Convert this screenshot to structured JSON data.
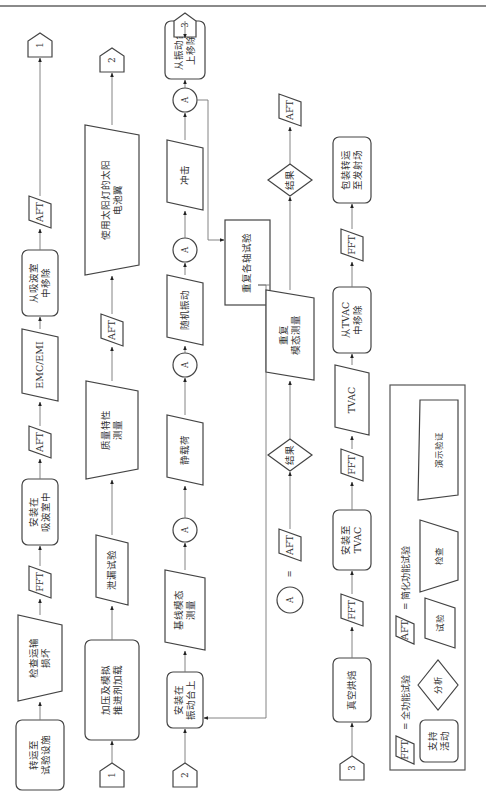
{
  "rows": [
    {
      "id": "row1",
      "nodes": [
        {
          "type": "rounded",
          "lines": [
            "转运至",
            "试验设施"
          ],
          "name": "node-transport-to-test-facility"
        },
        {
          "type": "trapezoid",
          "lines": [
            "检查运输",
            "损坏"
          ],
          "name": "node-inspect-shipping-damage"
        },
        {
          "type": "para",
          "lines": [
            "FFT"
          ],
          "name": "node-fft"
        },
        {
          "type": "rounded",
          "lines": [
            "安装在",
            "吸波室中"
          ],
          "name": "node-install-anechoic-chamber"
        },
        {
          "type": "para",
          "lines": [
            "AFT"
          ],
          "name": "node-aft"
        },
        {
          "type": "para",
          "lines": [
            "EMC/EMI"
          ],
          "name": "node-emc-emi"
        },
        {
          "type": "rounded",
          "lines": [
            "从吸波室",
            "中移除"
          ],
          "name": "node-remove-anechoic-chamber"
        },
        {
          "type": "para",
          "lines": [
            "AFT"
          ],
          "name": "node-aft"
        },
        {
          "type": "connector",
          "lines": [
            "1"
          ],
          "name": "offpage-connector-1"
        }
      ]
    },
    {
      "id": "row2",
      "nodes": [
        {
          "type": "connector",
          "lines": [
            "1"
          ],
          "name": "offpage-connector-1"
        },
        {
          "type": "rounded",
          "lines": [
            "加压及模拟",
            "推进剂加载"
          ],
          "name": "node-pressurize-propellant-load"
        },
        {
          "type": "para",
          "lines": [
            "泄漏试验"
          ],
          "name": "node-leak-test"
        },
        {
          "type": "trapezoid",
          "lines": [
            "质量特性",
            "测量"
          ],
          "name": "node-mass-properties"
        },
        {
          "type": "para",
          "lines": [
            "AFT"
          ],
          "name": "node-aft"
        },
        {
          "type": "trapezoid",
          "lines": [
            "使用太阳灯的太阳",
            "电池翼"
          ],
          "name": "node-solar-array-sun-lamp"
        },
        {
          "type": "connector",
          "lines": [
            "2"
          ],
          "name": "offpage-connector-2"
        }
      ]
    },
    {
      "id": "row3",
      "nodes": [
        {
          "type": "connector",
          "lines": [
            "2"
          ],
          "name": "offpage-connector-2"
        },
        {
          "type": "rounded",
          "lines": [
            "安装在",
            "振动台上"
          ],
          "name": "node-install-shaker"
        },
        {
          "type": "para",
          "lines": [
            "基线模态",
            "测量"
          ],
          "name": "node-baseline-modal"
        },
        {
          "type": "circle",
          "lines": [
            "A"
          ],
          "name": "node-a"
        },
        {
          "type": "para",
          "lines": [
            "静载荷"
          ],
          "name": "node-static-load"
        },
        {
          "type": "circle",
          "lines": [
            "A"
          ],
          "name": "node-a"
        },
        {
          "type": "para",
          "lines": [
            "随机振动"
          ],
          "name": "node-random-vibration"
        },
        {
          "type": "circle",
          "lines": [
            "A"
          ],
          "name": "node-a"
        },
        {
          "type": "para",
          "lines": [
            "冲击"
          ],
          "name": "node-shock"
        },
        {
          "type": "circle",
          "lines": [
            "A"
          ],
          "name": "node-a"
        },
        {
          "type": "rounded",
          "lines": [
            "从振动台",
            "上移除"
          ],
          "name": "node-remove-shaker"
        },
        {
          "type": "connector",
          "lines": [
            "3"
          ],
          "name": "offpage-connector-3"
        }
      ]
    },
    {
      "id": "row4",
      "nodes": [
        {
          "type": "connector",
          "lines": [
            "3"
          ],
          "name": "offpage-connector-3"
        },
        {
          "type": "rounded",
          "lines": [
            "真空烘焙"
          ],
          "name": "node-vacuum-bakeout"
        },
        {
          "type": "para",
          "lines": [
            "FFT"
          ],
          "name": "node-fft"
        },
        {
          "type": "rounded",
          "lines": [
            "安装至",
            "TVAC"
          ],
          "name": "node-install-tvac"
        },
        {
          "type": "para",
          "lines": [
            "FFT"
          ],
          "name": "node-fft"
        },
        {
          "type": "para",
          "lines": [
            "TVAC"
          ],
          "name": "node-tvac"
        },
        {
          "type": "rounded",
          "lines": [
            "从TVAC",
            "中移除"
          ],
          "name": "node-remove-tvac"
        },
        {
          "type": "para",
          "lines": [
            "FFT"
          ],
          "name": "node-fft"
        },
        {
          "type": "rounded",
          "lines": [
            "包装转运",
            "至发射场"
          ],
          "name": "node-ship-to-launch-site"
        }
      ]
    }
  ],
  "repeat_box": {
    "lines": [
      "重复各轴试验"
    ]
  },
  "a_definition": {
    "symbol": "A",
    "equals": "=",
    "nodes": [
      {
        "type": "para",
        "lines": [
          "AFT"
        ],
        "name": "node-aft"
      },
      {
        "type": "diamond",
        "lines": [
          "结果"
        ],
        "name": "node-results"
      },
      {
        "type": "para",
        "lines": [
          "重复",
          "模态测量"
        ],
        "name": "node-repeat-modal"
      },
      {
        "type": "diamond",
        "lines": [
          "结果"
        ],
        "name": "node-results"
      },
      {
        "type": "para",
        "lines": [
          "AFT"
        ],
        "name": "node-aft"
      }
    ]
  },
  "legend": {
    "fft_symbol": "FFT",
    "fft_desc": "= 全功能试验",
    "aft_symbol": "AFT",
    "aft_desc": "= 简化功能试验",
    "support": [
      "支持",
      "活动"
    ],
    "analysis": "分析",
    "test": "试验",
    "inspection": "检查",
    "demonstration": "演示验证"
  }
}
